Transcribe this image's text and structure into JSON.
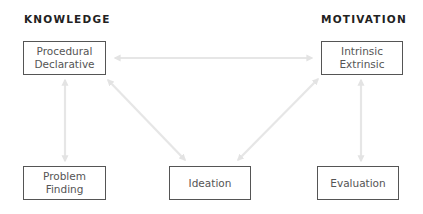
{
  "headings": {
    "left": "KNOWLEDGE",
    "right": "MOTIVATION"
  },
  "nodes": {
    "knowledge": {
      "lines": [
        "Procedural",
        "Declarative"
      ]
    },
    "motivation": {
      "lines": [
        "Intrinsic",
        "Extrinsic"
      ]
    },
    "problem_finding": {
      "lines": [
        "Problem",
        "Finding"
      ]
    },
    "ideation": {
      "lines": [
        "Ideation"
      ]
    },
    "evaluation": {
      "lines": [
        "Evaluation"
      ]
    }
  },
  "edges": [
    {
      "from": "knowledge",
      "to": "motivation",
      "direction": "both"
    },
    {
      "from": "knowledge",
      "to": "problem_finding",
      "direction": "both"
    },
    {
      "from": "knowledge",
      "to": "ideation",
      "direction": "both"
    },
    {
      "from": "motivation",
      "to": "ideation",
      "direction": "both"
    },
    {
      "from": "motivation",
      "to": "evaluation",
      "direction": "both"
    }
  ],
  "colors": {
    "arrow": "#e3e3e3",
    "box_border": "#555555",
    "text": "#555555",
    "heading": "#222222"
  }
}
